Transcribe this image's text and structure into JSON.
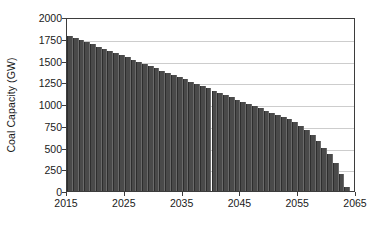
{
  "chart_data": {
    "type": "bar",
    "title": "",
    "xlabel": "",
    "ylabel": "Coal Capacity (GW)",
    "xlim": [
      2015,
      2065
    ],
    "ylim": [
      0,
      2000
    ],
    "grid": "horizontal",
    "legend": "none",
    "bar_color": "#4a4a4a",
    "gridline_color": "#cdcdcd",
    "axis_color": "#3d3d3d",
    "xticks": [
      2015,
      2025,
      2035,
      2045,
      2055,
      2065
    ],
    "yticks": [
      0,
      250,
      500,
      750,
      1000,
      1250,
      1500,
      1750,
      2000
    ],
    "xtick_labels": [
      "2015",
      "2025",
      "2035",
      "2045",
      "2055",
      "2065"
    ],
    "ytick_labels": [
      "0",
      "250",
      "500",
      "750",
      "1000",
      "1250",
      "1500",
      "1750",
      "2000"
    ],
    "categories": [
      2015,
      2016,
      2017,
      2018,
      2019,
      2020,
      2021,
      2022,
      2023,
      2024,
      2025,
      2026,
      2027,
      2028,
      2029,
      2030,
      2031,
      2032,
      2033,
      2034,
      2035,
      2036,
      2037,
      2038,
      2039,
      2040,
      2041,
      2042,
      2043,
      2044,
      2045,
      2046,
      2047,
      2048,
      2049,
      2050,
      2051,
      2052,
      2053,
      2054,
      2055,
      2056,
      2057,
      2058,
      2059,
      2060,
      2061,
      2062,
      2063
    ],
    "values": [
      1780,
      1760,
      1735,
      1710,
      1685,
      1660,
      1635,
      1610,
      1585,
      1560,
      1535,
      1510,
      1485,
      1460,
      1435,
      1410,
      1385,
      1360,
      1335,
      1310,
      1285,
      1255,
      1230,
      1205,
      1180,
      1150,
      1125,
      1100,
      1075,
      1050,
      1020,
      995,
      975,
      950,
      925,
      900,
      875,
      850,
      825,
      790,
      750,
      700,
      640,
      575,
      500,
      420,
      320,
      190,
      50
    ]
  }
}
